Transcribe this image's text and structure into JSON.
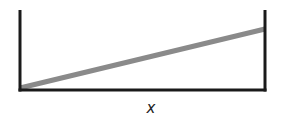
{
  "diagram": {
    "type": "container-with-sloped-surface",
    "x_label": "x",
    "container": {
      "left_wall": {
        "x": 20,
        "y_top": 10,
        "y_bottom": 90
      },
      "right_wall": {
        "x": 265,
        "y_top": 10,
        "y_bottom": 90
      },
      "base": {
        "y": 90,
        "x_start": 20,
        "x_end": 265
      },
      "stroke_color": "#1a1a1a"
    },
    "slope_line": {
      "x1": 20,
      "y1": 88,
      "x2": 265,
      "y2": 29,
      "color": "#8a8a8a",
      "width": 5
    }
  }
}
